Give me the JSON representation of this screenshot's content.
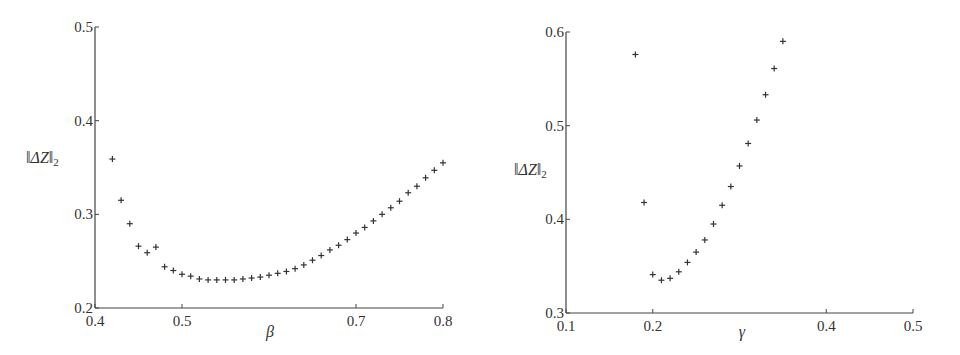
{
  "chart_data": [
    {
      "type": "scatter",
      "title": "",
      "xlabel": "β",
      "ylabel": "‖ΔZ‖₂",
      "ylabel_parts": {
        "open": "‖",
        "main": "ΔZ",
        "close": "‖",
        "sub": "2"
      },
      "xlim": [
        0.4,
        0.8
      ],
      "ylim": [
        0.2,
        0.5
      ],
      "xticks": [
        0.4,
        0.5,
        0.7,
        0.8
      ],
      "xtick_labels": [
        "0.4",
        "0.5",
        "0.7",
        "0.8"
      ],
      "yticks": [
        0.2,
        0.3,
        0.4,
        0.5
      ],
      "ytick_labels": [
        "0.2",
        "0.3",
        "0.4",
        "0.5"
      ],
      "grid": false,
      "marker": "+",
      "series": [
        {
          "name": "‖ΔZ‖₂ vs β",
          "x": [
            0.42,
            0.43,
            0.44,
            0.45,
            0.46,
            0.47,
            0.48,
            0.49,
            0.5,
            0.51,
            0.52,
            0.53,
            0.54,
            0.55,
            0.56,
            0.57,
            0.58,
            0.59,
            0.6,
            0.61,
            0.62,
            0.63,
            0.64,
            0.65,
            0.66,
            0.67,
            0.68,
            0.69,
            0.7,
            0.71,
            0.72,
            0.73,
            0.74,
            0.75,
            0.76,
            0.77,
            0.78,
            0.79,
            0.8
          ],
          "y": [
            0.359,
            0.315,
            0.29,
            0.266,
            0.259,
            0.265,
            0.244,
            0.24,
            0.236,
            0.234,
            0.231,
            0.23,
            0.23,
            0.23,
            0.23,
            0.231,
            0.232,
            0.233,
            0.235,
            0.237,
            0.239,
            0.242,
            0.246,
            0.251,
            0.256,
            0.262,
            0.267,
            0.273,
            0.28,
            0.286,
            0.293,
            0.3,
            0.307,
            0.314,
            0.323,
            0.33,
            0.339,
            0.347,
            0.355
          ]
        }
      ]
    },
    {
      "type": "scatter",
      "title": "",
      "xlabel": "γ",
      "ylabel": "‖ΔZ‖₂",
      "ylabel_parts": {
        "open": "‖",
        "main": "ΔZ",
        "close": "‖",
        "sub": "2"
      },
      "xlim": [
        0.1,
        0.5
      ],
      "ylim": [
        0.3,
        0.6
      ],
      "xticks": [
        0.1,
        0.2,
        0.4,
        0.5
      ],
      "xtick_labels": [
        "0.1",
        "0.2",
        "0.4",
        "0.5"
      ],
      "yticks": [
        0.3,
        0.4,
        0.5,
        0.6
      ],
      "ytick_labels": [
        "0.3",
        "0.4",
        "0.5",
        "0.6"
      ],
      "grid": false,
      "marker": "+",
      "series": [
        {
          "name": "‖ΔZ‖₂ vs γ",
          "x": [
            0.18,
            0.19,
            0.2,
            0.21,
            0.22,
            0.23,
            0.24,
            0.25,
            0.26,
            0.27,
            0.28,
            0.29,
            0.3,
            0.31,
            0.32,
            0.33,
            0.34,
            0.35
          ],
          "y": [
            0.576,
            0.418,
            0.341,
            0.335,
            0.337,
            0.344,
            0.354,
            0.365,
            0.378,
            0.395,
            0.415,
            0.435,
            0.457,
            0.481,
            0.506,
            0.533,
            0.561,
            0.59
          ]
        }
      ]
    }
  ]
}
